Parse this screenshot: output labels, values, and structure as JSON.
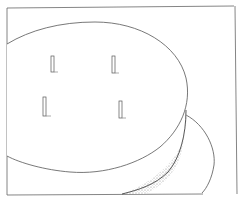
{
  "illustration": {
    "subject": "line drawing of a cylindrical disc with four pegs on its top surface, with a second disc beneath",
    "peg_count": 4,
    "colors": {
      "background": "#ffffff",
      "line": "#555555",
      "frame": "#666666",
      "shading": "#999999"
    }
  }
}
